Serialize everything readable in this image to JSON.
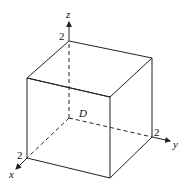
{
  "figure": {
    "type": "3d-cube-diagram",
    "region_label": "D",
    "axes": {
      "x": {
        "label": "x",
        "tick_label": "2"
      },
      "y": {
        "label": "y",
        "tick_label": "2"
      },
      "z": {
        "label": "z",
        "tick_label": "2"
      }
    }
  }
}
